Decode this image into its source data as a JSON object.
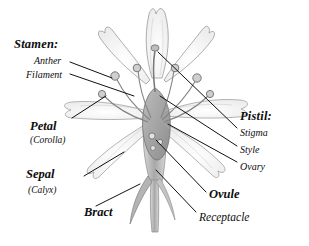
{
  "figure": {
    "background_color": "#ffffff",
    "ink_color": "#111111",
    "drawing_tone": "#9a9a9a"
  },
  "labels": {
    "stamen_group": "Stamen:",
    "anther": "Anther",
    "filament": "Filament",
    "petal": "Petal",
    "corolla": "(Corolla)",
    "sepal": "Sepal",
    "calyx": "(Calyx)",
    "bract": "Bract",
    "pistil_group": "Pistil:",
    "stigma": "Stigma",
    "style": "Style",
    "ovary": "Ovary",
    "ovule": "Ovule",
    "receptacle": "Receptacle"
  }
}
